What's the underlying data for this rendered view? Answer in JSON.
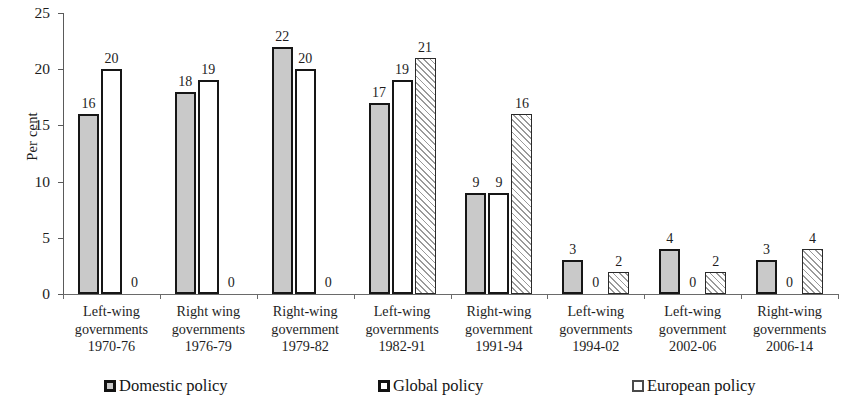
{
  "chart_data": {
    "type": "bar",
    "title": "",
    "xlabel": "",
    "ylabel": "Per cent",
    "ylim": [
      0,
      25
    ],
    "yticks": [
      0,
      5,
      10,
      15,
      20,
      25
    ],
    "ytick_labels": [
      "0",
      "5",
      "10",
      "15",
      "20",
      "25"
    ],
    "grid": false,
    "legend_position": "bottom",
    "categories": [
      "Left-wing governments 1970-76",
      "Right wing governments 1976-79",
      "Right-wing government 1979-82",
      "Left-wing governments 1982-91",
      "Right-wing government 1991-94",
      "Left-wing governments 1994-02",
      "Left-wing government 2002-06",
      "Right-wing governments 2006-14"
    ],
    "category_lines": [
      [
        "Left-wing",
        "governments",
        "1970-76"
      ],
      [
        "Right wing",
        "governments",
        "1976-79"
      ],
      [
        "Right-wing",
        "government",
        "1979-82"
      ],
      [
        "Left-wing",
        "governments",
        "1982-91"
      ],
      [
        "Right-wing",
        "government",
        "1991-94"
      ],
      [
        "Left-wing",
        "governments",
        "1994-02"
      ],
      [
        "Left-wing",
        "government",
        "2002-06"
      ],
      [
        "Right-wing",
        "governments",
        "2006-14"
      ]
    ],
    "series": [
      {
        "name": "Domestic policy",
        "pattern": "solid-gray",
        "values": [
          16,
          18,
          22,
          17,
          9,
          3,
          4,
          3
        ]
      },
      {
        "name": "Global policy",
        "pattern": "white",
        "values": [
          20,
          19,
          20,
          19,
          9,
          0,
          0,
          0
        ]
      },
      {
        "name": "European policy",
        "pattern": "diagonal-hatch",
        "values": [
          0,
          0,
          0,
          21,
          16,
          2,
          2,
          4
        ]
      }
    ],
    "data_labels": [
      [
        "16",
        "20",
        "0"
      ],
      [
        "18",
        "19",
        "0"
      ],
      [
        "22",
        "20",
        "0"
      ],
      [
        "17",
        "19",
        "21"
      ],
      [
        "9",
        "9",
        "16"
      ],
      [
        "3",
        "0",
        "2"
      ],
      [
        "4",
        "0",
        "2"
      ],
      [
        "3",
        "0",
        "4"
      ]
    ],
    "colors": {
      "domestic_fill": "#c9c9c9",
      "global_fill": "#ffffff",
      "european_fill": "#ffffff",
      "bar_outline": "#161616",
      "axis": "#5a5a5a",
      "text": "#1d1d1d",
      "background": "#ffffff"
    }
  },
  "legend": {
    "items": [
      {
        "label": "Domestic policy",
        "swatch": "domestic"
      },
      {
        "label": "Global policy",
        "swatch": "global"
      },
      {
        "label": "European policy",
        "swatch": "european"
      }
    ]
  }
}
